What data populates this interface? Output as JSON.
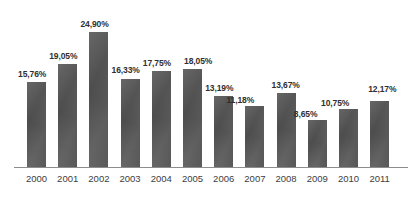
{
  "chart_data": {
    "type": "bar",
    "title": "",
    "subtitle": "",
    "xlabel": "",
    "ylabel": "",
    "grid": false,
    "legend": false,
    "axis_visible": {
      "x": true,
      "y": false
    },
    "ylim": [
      0,
      24.9
    ],
    "value_suffix": "%",
    "decimal_separator": ",",
    "categories": [
      "2000",
      "2001",
      "2002",
      "2003",
      "2004",
      "2005",
      "2006",
      "2007",
      "2008",
      "2009",
      "2010",
      "2011"
    ],
    "values": [
      15.76,
      19.05,
      24.9,
      16.33,
      17.75,
      18.05,
      13.19,
      11.18,
      13.67,
      8.65,
      10.75,
      12.17
    ],
    "data_labels": [
      "15,76%",
      "19,05%",
      "24,90%",
      "16,33%",
      "17,75%",
      "18,05%",
      "13,19%",
      "11,18%",
      "13,67%",
      "8,65%",
      "10,75%",
      "12,17%"
    ],
    "bar_color": "#565656",
    "axis_color": "#8d8d8d",
    "background_color": "#ffffff",
    "label_offsets": [
      {
        "dx": -9,
        "dy": -12
      },
      {
        "dx": -9,
        "dy": -12
      },
      {
        "dx": -9,
        "dy": -12
      },
      {
        "dx": -9,
        "dy": -12
      },
      {
        "dx": -9,
        "dy": -12
      },
      {
        "dx": 1,
        "dy": -12
      },
      {
        "dx": -9,
        "dy": -12
      },
      {
        "dx": -19,
        "dy": -10
      },
      {
        "dx": -5,
        "dy": -12
      },
      {
        "dx": -14,
        "dy": -10
      },
      {
        "dx": -18,
        "dy": -10
      },
      {
        "dx": -2,
        "dy": -16
      }
    ]
  }
}
